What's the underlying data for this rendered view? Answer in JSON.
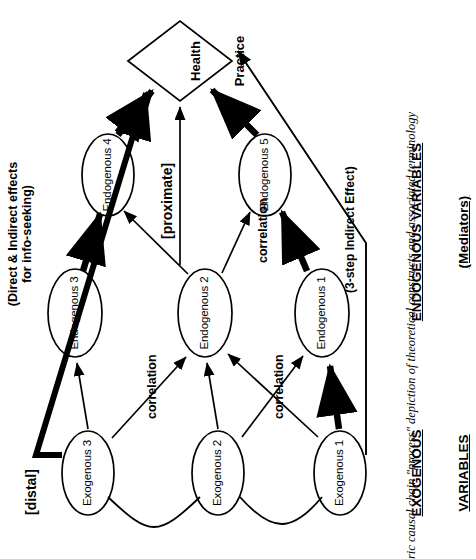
{
  "figure": {
    "caption": "ric causal chain \"process\" depiction of theoretical constructs and associated terminology",
    "outcome_node": {
      "line1": "Health",
      "line2": "Practice"
    },
    "notes": {
      "info_seeking": "(Direct & Indirect effects\nfor info-seeking)",
      "three_step": "(3-step Indirect Effect)"
    },
    "stage_tags": {
      "distal": "[distal]",
      "proximate": "[proximate]"
    },
    "groups": {
      "exogenous": {
        "line1": "EXOGENOUS",
        "line2": "VARIABLES"
      },
      "endogenous": {
        "line1": "ENDOGENOUS VARIABLES",
        "line2": "(Mediators)"
      }
    },
    "exogenous_nodes": [
      {
        "id": "exo3",
        "label": "Exogenous 3"
      },
      {
        "id": "exo2",
        "label": "Exogenous 2"
      },
      {
        "id": "exo1",
        "label": "Exogenous 1"
      }
    ],
    "endogenous_nodes": [
      {
        "id": "end3",
        "label": "Endogenous 3"
      },
      {
        "id": "end2",
        "label": "Endogenous 2"
      },
      {
        "id": "end1",
        "label": "Endogenous 1"
      },
      {
        "id": "end4",
        "label": "Endogenous 4"
      },
      {
        "id": "end5",
        "label": "Endogenous 5"
      }
    ],
    "correlation_labels": [
      {
        "id": "corr-exo3-exo2",
        "label": "correlation"
      },
      {
        "id": "corr-exo2-exo1",
        "label": "correlation"
      },
      {
        "id": "corr-end2-end1",
        "label": "correlation"
      }
    ],
    "colors": {
      "ink": "#000000",
      "paper": "#ffffff"
    }
  }
}
